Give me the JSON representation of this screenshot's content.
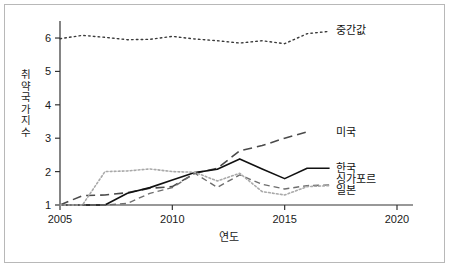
{
  "chart_data": {
    "type": "line",
    "title": "",
    "xlabel": "연도",
    "ylabel": "취약국가지수",
    "ylabel_chars": [
      "취",
      "약",
      "국",
      "가",
      "지",
      "수"
    ],
    "xlim": [
      2005,
      2020
    ],
    "ylim": [
      1,
      6.45
    ],
    "xticks": [
      2005,
      2010,
      2015,
      2020
    ],
    "yticks": [
      1,
      2,
      3,
      4,
      5,
      6
    ],
    "xtick_labels": [
      "2005",
      "2010",
      "2015",
      "2020"
    ],
    "ytick_labels": [
      "1",
      "2",
      "3",
      "4",
      "5",
      "6"
    ],
    "grid": false,
    "legend_position": "right-inline",
    "series": [
      {
        "name": "중간값",
        "label": "중간값",
        "style": "dotted",
        "color": "#3a3a3a",
        "width": 1.4,
        "label_x": 2017.1,
        "label_y": 6.25,
        "x": [
          2005,
          2006,
          2007,
          2008,
          2009,
          2010,
          2011,
          2012,
          2013,
          2014,
          2015,
          2016,
          2017
        ],
        "y": [
          5.98,
          6.08,
          6.02,
          5.95,
          5.96,
          6.05,
          5.97,
          5.92,
          5.85,
          5.92,
          5.83,
          6.13,
          6.2
        ]
      },
      {
        "name": "미국",
        "label": "미국",
        "style": "dashed",
        "color": "#4a4a4a",
        "width": 1.6,
        "label_x": 2017.1,
        "label_y": 3.2,
        "x": [
          2005,
          2006,
          2007,
          2008,
          2009,
          2010,
          2011,
          2012,
          2013,
          2014,
          2015,
          2016
        ],
        "y": [
          1.0,
          1.28,
          1.3,
          1.37,
          1.5,
          1.55,
          1.95,
          2.1,
          2.62,
          2.78,
          3.0,
          3.19
        ]
      },
      {
        "name": "한국",
        "label": "한국",
        "style": "solid",
        "color": "#111111",
        "width": 1.6,
        "label_x": 2017.1,
        "label_y": 2.1,
        "x": [
          2005,
          2006,
          2007,
          2008,
          2009,
          2010,
          2011,
          2012,
          2013,
          2014,
          2015,
          2016,
          2017
        ],
        "y": [
          1.0,
          1.0,
          1.0,
          1.35,
          1.52,
          1.75,
          1.97,
          2.07,
          2.38,
          2.08,
          1.79,
          2.1,
          2.1
        ]
      },
      {
        "name": "싱가포르",
        "label": "싱가포르",
        "style": "dashed-fine",
        "color": "#6e6e6e",
        "width": 1.4,
        "label_x": 2017.1,
        "label_y": 1.78,
        "x": [
          2005,
          2006,
          2007,
          2008,
          2009,
          2010,
          2011,
          2012,
          2013,
          2014,
          2015,
          2016,
          2017
        ],
        "y": [
          1.0,
          1.0,
          1.0,
          1.05,
          1.35,
          1.52,
          1.95,
          1.53,
          1.9,
          1.62,
          1.48,
          1.58,
          1.6
        ]
      },
      {
        "name": "일본",
        "label": "일본",
        "style": "dotted-light",
        "color": "#a9a9a9",
        "width": 1.6,
        "label_x": 2017.1,
        "label_y": 1.45,
        "x": [
          2005,
          2006,
          2007,
          2008,
          2009,
          2010,
          2011,
          2012,
          2013,
          2014,
          2015,
          2016,
          2017
        ],
        "y": [
          1.0,
          1.0,
          2.0,
          2.02,
          2.08,
          2.0,
          1.98,
          1.72,
          1.95,
          1.4,
          1.3,
          1.55,
          1.58
        ]
      }
    ]
  }
}
